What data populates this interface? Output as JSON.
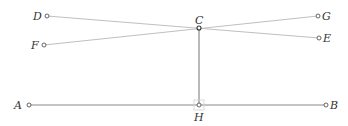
{
  "diagram": {
    "points": {
      "A": {
        "label": "A",
        "x": 29,
        "y": 105
      },
      "B": {
        "label": "B",
        "x": 326,
        "y": 105
      },
      "C": {
        "label": "C",
        "x": 199,
        "y": 28
      },
      "D": {
        "label": "D",
        "x": 47,
        "y": 16
      },
      "E": {
        "label": "E",
        "x": 319,
        "y": 38
      },
      "F": {
        "label": "F",
        "x": 44,
        "y": 45
      },
      "G": {
        "label": "G",
        "x": 318,
        "y": 16
      },
      "H": {
        "label": "H",
        "x": 199,
        "y": 105
      }
    },
    "segments": [
      "D-E",
      "F-G",
      "C-H",
      "A-B"
    ],
    "right_angle_at": "H",
    "colors": {
      "thin_line": "#b8b8b8",
      "thick_line": "#8a8a8a",
      "point_stroke": "#555555",
      "label": "#333333"
    }
  }
}
